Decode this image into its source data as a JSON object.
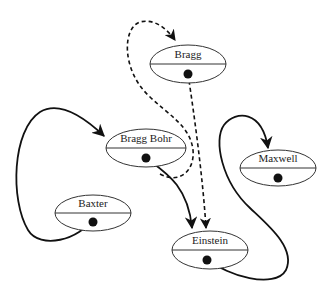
{
  "diagram": {
    "title": "",
    "nodes": [
      {
        "id": "bragg",
        "label": "Bragg",
        "cx": 188,
        "cy": 64,
        "rx": 38,
        "ry": 19
      },
      {
        "id": "bragg_bohr",
        "label": "Bragg Bohr",
        "cx": 146,
        "cy": 148,
        "rx": 40,
        "ry": 19
      },
      {
        "id": "maxwell",
        "label": "Maxwell",
        "cx": 278,
        "cy": 168,
        "rx": 38,
        "ry": 18
      },
      {
        "id": "baxter",
        "label": "Baxter",
        "cx": 93,
        "cy": 213,
        "rx": 38,
        "ry": 18
      },
      {
        "id": "einstein",
        "label": "Einstein",
        "cx": 210,
        "cy": 250,
        "rx": 38,
        "ry": 19
      }
    ],
    "edges": [
      {
        "from": "baxter",
        "to": "bragg_bohr",
        "style": "solid"
      },
      {
        "from": "bragg_bohr",
        "to": "einstein",
        "style": "solid"
      },
      {
        "from": "einstein",
        "to": "maxwell",
        "style": "solid"
      },
      {
        "from": "bragg",
        "to": "einstein",
        "style": "dashed"
      },
      {
        "from": "bragg_bohr",
        "to": "bragg",
        "style": "dashed"
      }
    ]
  }
}
